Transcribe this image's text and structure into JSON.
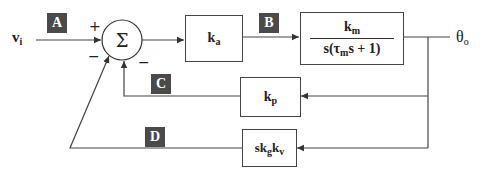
{
  "diagram": {
    "type": "block-diagram",
    "input": {
      "label": "v",
      "sub": "i"
    },
    "output": {
      "label": "θ",
      "sub": "o"
    },
    "summing_junction": {
      "symbol": "Σ",
      "signs": [
        "+",
        "−",
        "−"
      ]
    },
    "blocks": {
      "ka": {
        "main": "k",
        "sub": "a"
      },
      "plant": {
        "num_main": "k",
        "num_sub": "m",
        "den_pre": "s(τ",
        "den_sub": "m",
        "den_post": "s + 1)"
      },
      "kp": {
        "main": "k",
        "sub": "p"
      },
      "tach": {
        "s": "s",
        "k1": "k",
        "k1_sub": "g",
        "k2": "k",
        "k2_sub": "v"
      }
    },
    "signal_tags": {
      "a": "A",
      "b": "B",
      "c": "C",
      "d": "D"
    }
  }
}
